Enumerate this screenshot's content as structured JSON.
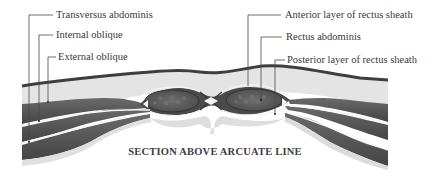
{
  "figure": {
    "caption": "SECTION ABOVE ARCUATE LINE",
    "left_labels": [
      {
        "text": "Transversus abdominis"
      },
      {
        "text": "Internal oblique"
      },
      {
        "text": "External oblique"
      }
    ],
    "right_labels": [
      {
        "text": "Anterior layer of rectus sheath"
      },
      {
        "text": "Rectus abdominis"
      },
      {
        "text": "Posterior layer of rectus sheath"
      }
    ]
  },
  "colors": {
    "muscle": "#5a5a5a",
    "muscle_dark": "#3c3c3c",
    "fascia_light": "#d8d8d8",
    "subcutaneous": "#e6e6e6",
    "leader_line": "#4a4a4a",
    "text": "#3a3a3a"
  }
}
